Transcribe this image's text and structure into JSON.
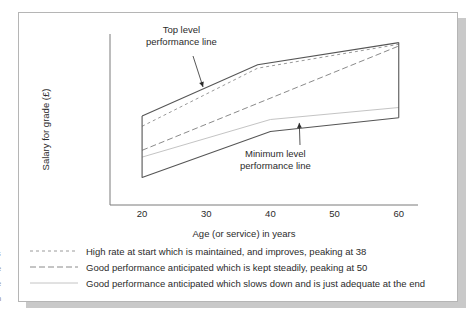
{
  "chart_data": {
    "type": "line",
    "title": "",
    "xlabel": "Age (or service) in years",
    "ylabel": "Salary for grade (£)",
    "xlim": [
      15,
      63
    ],
    "ylim": [
      0,
      100
    ],
    "xticks": [
      20,
      30,
      40,
      50,
      60
    ],
    "xtick_labels": [
      "20",
      "30",
      "40",
      "50",
      "60"
    ],
    "yticks": [],
    "ytick_labels": [],
    "grid": false,
    "legend_position": "below-plot",
    "series": [
      {
        "name": "top-level-performance-line",
        "label": "Top level performance line",
        "style": "solid",
        "color": "#555555",
        "x": [
          20,
          38,
          60
        ],
        "y": [
          52,
          82,
          95
        ]
      },
      {
        "name": "high-rate-maintained-line",
        "label": "High rate at start which is maintained, and improves, peaking at 38",
        "style": "fine-dashed",
        "color": "#9a9a9a",
        "x": [
          20,
          38,
          60
        ],
        "y": [
          46,
          80,
          94
        ]
      },
      {
        "name": "good-performance-steady-line",
        "label": "Good performance anticipated which is kept steadily, peaking at 50",
        "style": "long-dashed",
        "color": "#8a8a8a",
        "x": [
          20,
          60
        ],
        "y": [
          32,
          93
        ]
      },
      {
        "name": "good-performance-slowing-line",
        "label": "Good performance anticipated which slows down and is just adequate at the end",
        "style": "solid-light",
        "color": "#c4c4c4",
        "x": [
          20,
          40,
          60
        ],
        "y": [
          28,
          50,
          57
        ]
      },
      {
        "name": "minimum-level-performance-line",
        "label": "Minimum level performance line",
        "style": "solid",
        "color": "#555555",
        "x": [
          20,
          40,
          60
        ],
        "y": [
          16,
          43,
          51
        ]
      }
    ],
    "connectors": [
      {
        "name": "left-band-edge",
        "x": 20,
        "y_from": 16,
        "y_to": 52
      },
      {
        "name": "right-band-edge",
        "x": 60,
        "y_from": 51,
        "y_to": 95
      }
    ],
    "annotations": [
      {
        "name": "top-level-annotation",
        "lines": [
          "Top level",
          "performance line"
        ],
        "arrow_to": {
          "x": 29.5,
          "y": 69
        }
      },
      {
        "name": "minimum-level-annotation",
        "lines": [
          "Minimum level",
          "performance line"
        ],
        "arrow_to": {
          "x": 44.5,
          "y": 48
        }
      }
    ]
  },
  "legend": {
    "items": [
      {
        "name": "legend-item-high-rate",
        "style": "fine-dashed",
        "text": "High rate at start which is maintained, and improves, peaking at 38"
      },
      {
        "name": "legend-item-steady",
        "style": "long-dashed",
        "text": "Good performance anticipated which is kept steadily, peaking at 50"
      },
      {
        "name": "legend-item-slowing",
        "style": "solid-light",
        "text": "Good performance anticipated which slows down and is just adequate at the end"
      }
    ]
  },
  "margin_fragments": [
    "s",
    "e",
    "e",
    "n"
  ],
  "colors": {
    "frame_border": "#b5b5b5",
    "shadow": "#c9c9c9",
    "axis": "#7a7a7a",
    "line_dark": "#555555",
    "line_mid": "#8a8a8a",
    "line_light": "#c4c4c4",
    "text": "#2b2b2b",
    "background": "#ffffff"
  }
}
